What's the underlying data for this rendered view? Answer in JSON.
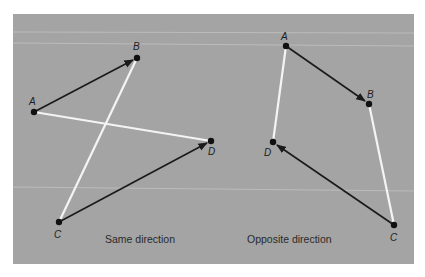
{
  "figure": {
    "background_color": "#a4a4a4",
    "vector_color": "#1a1a1a",
    "segment_color": "#f4f4f4"
  },
  "left_diagram": {
    "caption": "Same direction",
    "points": {
      "A": {
        "label": "A",
        "x": 34,
        "y": 112
      },
      "B": {
        "label": "B",
        "x": 137,
        "y": 58
      },
      "C": {
        "label": "C",
        "x": 59,
        "y": 222
      },
      "D": {
        "label": "D",
        "x": 211,
        "y": 141
      }
    },
    "vectors": [
      {
        "from": "A",
        "to": "B"
      },
      {
        "from": "C",
        "to": "D"
      }
    ],
    "segments": [
      {
        "from": "A",
        "to": "D"
      },
      {
        "from": "B",
        "to": "C"
      }
    ]
  },
  "right_diagram": {
    "caption": "Opposite direction",
    "points": {
      "A": {
        "label": "A",
        "x": 286,
        "y": 46
      },
      "B": {
        "label": "B",
        "x": 369,
        "y": 104
      },
      "C": {
        "label": "C",
        "x": 394,
        "y": 225
      },
      "D": {
        "label": "D",
        "x": 273,
        "y": 142
      }
    },
    "vectors": [
      {
        "from": "A",
        "to": "B"
      },
      {
        "from": "C",
        "to": "D"
      }
    ],
    "segments": [
      {
        "from": "A",
        "to": "D"
      },
      {
        "from": "B",
        "to": "C"
      }
    ]
  }
}
